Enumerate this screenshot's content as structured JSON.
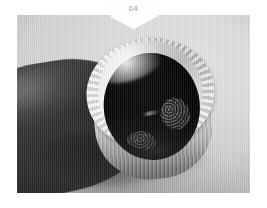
{
  "page": {
    "background_color": "#ffffff",
    "width": 267,
    "height": 208
  },
  "banner": {
    "label": "04",
    "shape": "downward-pointing-pentagon",
    "background_color": "#fdfdfd",
    "text_color": "#9a9a9a"
  },
  "photo": {
    "alt": "A hand holding a white crocheted cylindrical cup, viewed into its dark open mouth",
    "backdrop_color": "#d8d8d8",
    "subject": {
      "name": "crocheted-tube",
      "rim_color": "#ffffff",
      "opening_color": "#070707",
      "body_color": "#e8e8e8"
    },
    "hand": {
      "name": "hand",
      "tone": "#2a2a2a"
    },
    "inner_items": [
      {
        "name": "crochet-bobble-right",
        "color": "#3a3a3a"
      },
      {
        "name": "crochet-bobble-lower",
        "color": "#2d2d2d"
      },
      {
        "name": "yarn-strand",
        "color": "#c8c8c8"
      }
    ]
  }
}
